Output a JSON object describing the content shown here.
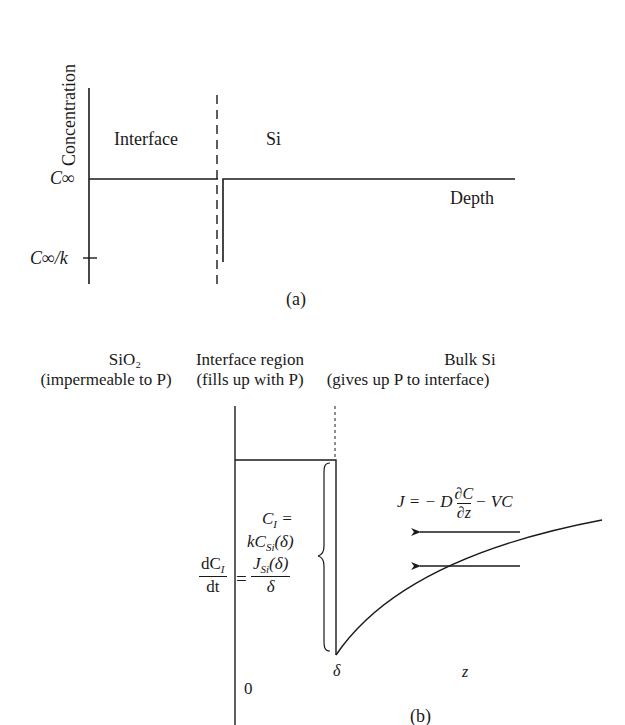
{
  "panel_a": {
    "caption": "(a)",
    "y_axis_label": "Concentration",
    "x_axis_label": "Depth",
    "region_labels": [
      "Interface",
      "Si"
    ],
    "ticks": {
      "c_inf": "C∞",
      "c_inf_over_k_main": "C∞",
      "c_inf_over_k_suffix": "/k"
    }
  },
  "panel_b": {
    "caption": "(b)",
    "regions": [
      {
        "title": "SiO₂",
        "subtitle": "(impermeable to P)"
      },
      {
        "title": "Interface region",
        "subtitle": "(fills up with P)"
      },
      {
        "title": "Bulk Si",
        "subtitle": "(gives up P to interface)"
      }
    ],
    "equations": {
      "ci_lhs": "C",
      "ci_sub": "I",
      "ci_eq": " =",
      "k_csi": "kC",
      "k_csi_sub": "Si",
      "k_csi_arg": "(δ)",
      "dci_num": "dC",
      "dci_num_sub": "I",
      "dci_den": "dt",
      "equals": "=",
      "jsi_num": "J",
      "jsi_sub": "Si",
      "jsi_arg": "(δ)",
      "jsi_den": "δ",
      "flux_lhs": "J = − D",
      "flux_num": "∂C",
      "flux_den": "∂z",
      "flux_rhs": "− VC"
    },
    "axis_labels": {
      "delta": "δ",
      "z": "z",
      "origin": "0"
    }
  },
  "colors": {
    "ink": "#1a1a1a",
    "background": "#ffffff"
  }
}
